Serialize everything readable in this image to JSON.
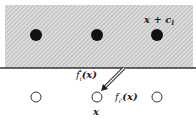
{
  "diagram": {
    "region": {
      "fill": "#d8d8d8",
      "hatch": "#9a9a9a",
      "top": 5,
      "boundary_y": 68
    },
    "filled_points": [
      {
        "x": 36,
        "y": 35
      },
      {
        "x": 97,
        "y": 35
      },
      {
        "x": 157,
        "y": 35
      }
    ],
    "open_points": [
      {
        "x": 36,
        "y": 97
      },
      {
        "x": 97,
        "y": 97
      },
      {
        "x": 157,
        "y": 97
      }
    ],
    "labels": {
      "shifted_point": "x + c",
      "shifted_point_sub": "i",
      "f_star": "f",
      "f_star_sub": "i",
      "f_star_sup": "*",
      "f_star_arg": "(x)",
      "f_prime": "f",
      "f_prime_sub": "i'",
      "f_prime_arg": "(x)",
      "point": "x"
    }
  }
}
